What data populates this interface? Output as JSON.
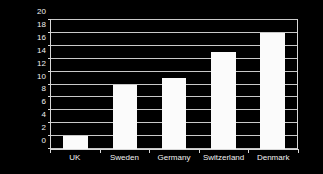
{
  "chart_data": {
    "type": "bar",
    "title": "",
    "subtitle": "",
    "xlabel": "",
    "ylabel": "Percentage",
    "categories": [
      "UK",
      "Sweden",
      "Germany",
      "Switzerland",
      "Denmark"
    ],
    "values": [
      2,
      10,
      11,
      15,
      18
    ],
    "ylim": [
      0,
      20
    ],
    "ytick_step": 2,
    "yticks": [
      0,
      2,
      4,
      6,
      8,
      10,
      12,
      14,
      16,
      18,
      20
    ],
    "ytick_labels": [
      "0",
      "2",
      "4",
      "6",
      "8",
      "10",
      "12",
      "14",
      "16",
      "18",
      "20"
    ],
    "grid": true,
    "grid_axis": "y",
    "legend": false,
    "legend_position": "none",
    "colors": {
      "background": "#000000",
      "bar": "#fbfbfb",
      "gridline": "#c9c9c9",
      "axis": "#d8d8d8",
      "text": "#f0f0f0"
    }
  }
}
